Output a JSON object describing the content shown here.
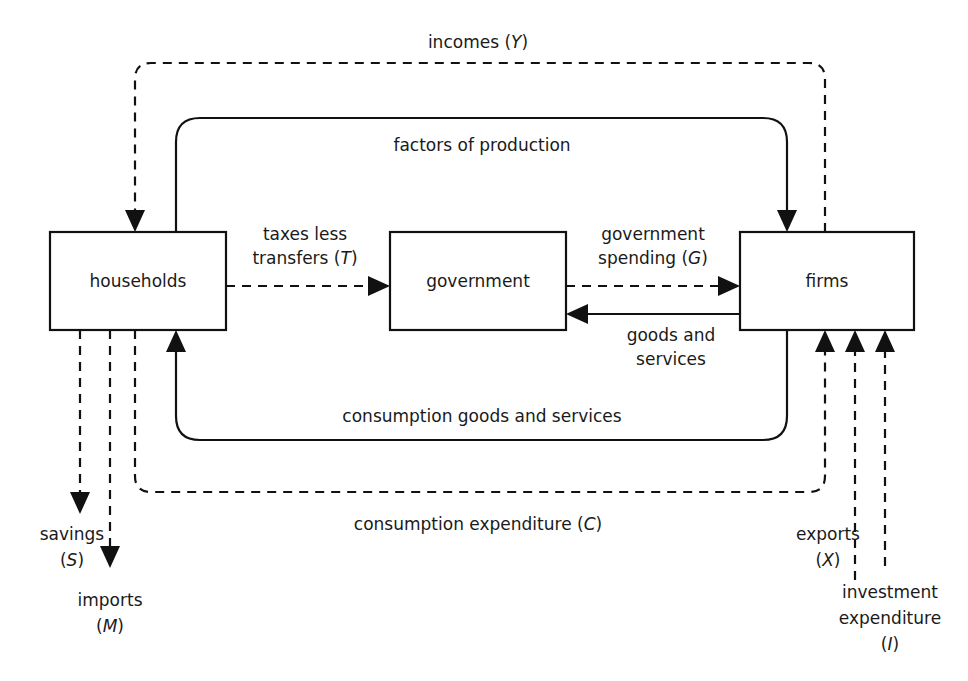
{
  "diagram": {
    "background_color": "#ffffff",
    "line_color": "#111111",
    "nodes": [
      {
        "id": "households",
        "label": "households"
      },
      {
        "id": "government",
        "label": "government"
      },
      {
        "id": "firms",
        "label": "firms"
      }
    ],
    "flows": {
      "incomes": {
        "label_text": "incomes",
        "symbol": "Y",
        "full": "incomes (Y)",
        "style": "dashed",
        "from": "firms",
        "to": "households"
      },
      "factors_of_production": {
        "label_text": "factors of production",
        "symbol": "",
        "full": "factors of production",
        "style": "solid",
        "from": "households",
        "to": "firms"
      },
      "taxes_less_transfers": {
        "label_line1": "taxes less",
        "label_line2": "transfers",
        "symbol": "T",
        "full": "taxes less transfers (T)",
        "style": "dashed",
        "from": "households",
        "to": "government"
      },
      "government_spending": {
        "label_line1": "government",
        "label_line2": "spending",
        "symbol": "G",
        "full": "government spending (G)",
        "style": "dashed",
        "from": "government",
        "to": "firms"
      },
      "goods_and_services": {
        "label_line1": "goods and",
        "label_line2": "services",
        "symbol": "",
        "full": "goods and services",
        "style": "solid",
        "from": "firms",
        "to": "government"
      },
      "consumption_goods_and_services": {
        "label_text": "consumption goods and services",
        "symbol": "",
        "full": "consumption goods and services",
        "style": "solid",
        "from": "firms",
        "to": "households"
      },
      "consumption_expenditure": {
        "label_text": "consumption expenditure",
        "symbol": "C",
        "full": "consumption expenditure (C)",
        "style": "dashed",
        "from": "households",
        "to": "firms"
      },
      "savings": {
        "label_line1": "savings",
        "symbol": "S",
        "symbol_wrapped": "(S)",
        "full": "savings (S)",
        "style": "dashed",
        "from": "households",
        "to": "leakage"
      },
      "imports": {
        "label_line1": "imports",
        "symbol": "M",
        "symbol_wrapped": "(M)",
        "full": "imports (M)",
        "style": "dashed",
        "from": "households",
        "to": "leakage"
      },
      "exports": {
        "label_line1": "exports",
        "symbol": "X",
        "symbol_wrapped": "(X)",
        "full": "exports (X)",
        "style": "dashed",
        "from": "injection",
        "to": "firms"
      },
      "investment_expenditure": {
        "label_line1": "investment",
        "label_line2": "expenditure",
        "symbol": "I",
        "symbol_wrapped": "(I)",
        "full": "investment expenditure (I)",
        "style": "dashed",
        "from": "injection",
        "to": "firms"
      }
    }
  }
}
